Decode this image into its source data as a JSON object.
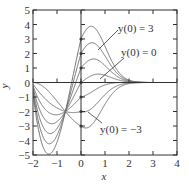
{
  "chart_data": {
    "type": "line",
    "title": "",
    "xlabel": "x",
    "ylabel": "y",
    "xlim": [
      -2,
      4
    ],
    "ylim": [
      -5,
      5
    ],
    "grid": false,
    "x_ticks": [
      -2,
      -1,
      0,
      1,
      2,
      3,
      4
    ],
    "y_ticks": [
      -5,
      -4,
      -3,
      -2,
      -1,
      0,
      1,
      2,
      3,
      4,
      5
    ],
    "x_tick_labels": [
      "−2",
      "−1",
      "0",
      "1",
      "2",
      "3",
      "4"
    ],
    "y_tick_labels": [
      "−5",
      "−4",
      "−3",
      "−2",
      "−1",
      "0",
      "1",
      "2",
      "3",
      "4",
      "5"
    ],
    "common_point": {
      "x": -0.65,
      "y": -2
    },
    "series": [
      {
        "name": "y(0) = 3",
        "initial_value": 3
      },
      {
        "name": "y(0) = 2",
        "initial_value": 2
      },
      {
        "name": "y(0) = 1",
        "initial_value": 1
      },
      {
        "name": "y(0) = 0",
        "initial_value": 0
      },
      {
        "name": "y(0) = -1",
        "initial_value": -1
      },
      {
        "name": "y(0) = -2",
        "initial_value": -2
      },
      {
        "name": "y(0) = -3",
        "initial_value": -3
      }
    ],
    "annotations": [
      {
        "text": "y(0) = 3",
        "points_to_series": "y(0) = 3"
      },
      {
        "text": "y(0) = 0",
        "points_to_series": "y(0) = 0"
      },
      {
        "text": "y(0) = −3",
        "points_to_series": "y(0) = -3"
      }
    ],
    "colors": {
      "curve": "#6e6e6e",
      "axis": "#333333",
      "marker": "#444444"
    }
  }
}
